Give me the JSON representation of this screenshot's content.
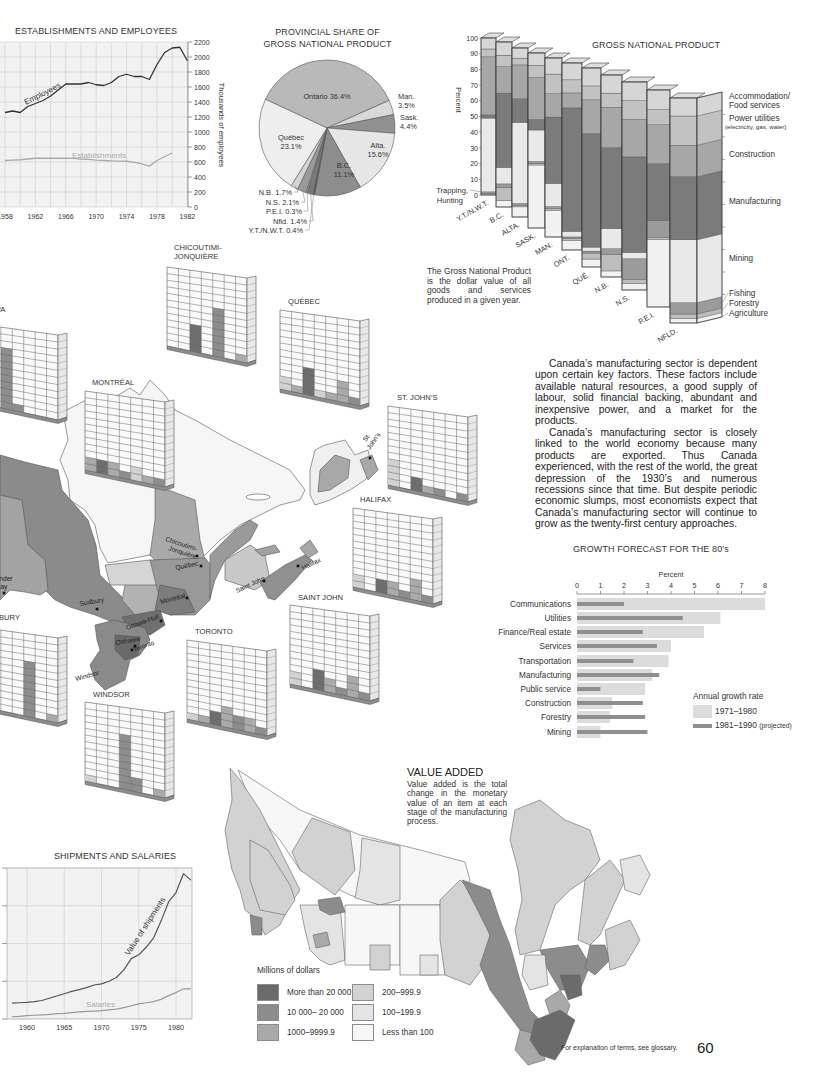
{
  "page": {
    "footnote": "For explanation of terms, see glossary.",
    "page_number": "60"
  },
  "establishments": {
    "title": "ESTABLISHMENTS AND EMPLOYEES",
    "y_axis_label": "Thousands of employees"
  },
  "pie": {
    "title_line1": "PROVINCIAL SHARE OF",
    "title_line2": "GROSS NATIONAL PRODUCT"
  },
  "gnp": {
    "title": "GROSS NATIONAL PRODUCT",
    "y_axis_label": "Percent",
    "trapping_label_line1": "Trapping,",
    "trapping_label_line2": "Hunting",
    "note": "The Gross National Product is the dollar value of all goods and services produced in a given year.",
    "sector_label_lines": [
      [
        "Agriculture"
      ],
      [
        "Forestry"
      ],
      [
        "Fishing"
      ],
      [
        "Mining"
      ],
      [
        "Manufacturing"
      ],
      [
        "Construction"
      ],
      [
        "Power utilities",
        "(electricity, gas, water)"
      ],
      [
        "Accommodation/",
        "Food services"
      ]
    ]
  },
  "body_text": {
    "p1": "Canada’s manufacturing sector is dependent upon certain key factors. These factors include available natural resources, a good supply of labour, solid financial backing, abundant and inexpensive power, and a market for the products.",
    "p2": "Canada’s manufacturing sector is closely linked to the world economy because many products are exported. Thus Canada experienced, with the rest of the world, the great depression of the 1930’s and numerous recessions since that time. But despite periodic economic slumps, most economists expect that Canada’s manufacturing sector will continue to grow as the twenty-first century approaches."
  },
  "growth": {
    "title": "GROWTH FORECAST FOR THE 80’s",
    "legend_title": "Annual growth rate",
    "legend_1": "1971–1980",
    "legend_2": "1981–1990",
    "legend_2_note": "(projected)"
  },
  "shipments": {
    "title": "SHIPMENTS AND SALARIES"
  },
  "value_added": {
    "title": "VALUE ADDED",
    "description": "Value added is the total change in the monetary value of an item at each stage of the manufacturing process.",
    "legend_title": "Millions of dollars",
    "legend": [
      {
        "label": "More than 20 000",
        "color": "#6b6b6b"
      },
      {
        "label": "10 000– 20 000",
        "color": "#8c8c8c"
      },
      {
        "label": "1000–9999.9",
        "color": "#a9a9a9"
      },
      {
        "label": "200–999.9",
        "color": "#d2d2d2"
      },
      {
        "label": "100–199.9",
        "color": "#e4e4e4"
      },
      {
        "label": "Less than 100",
        "color": "#f7f7f7"
      }
    ]
  },
  "map_labels": {
    "sudbury": "Sudbury",
    "chicoutimi_1": "Chicoutimi-",
    "chicoutimi_2": "Jonquière",
    "quebec": "Québec",
    "montreal": "Montréal",
    "ottawa_hull": "Ottawa-Hull",
    "oshawa": "Oshawa",
    "toronto": "Toronto",
    "windsor": "Windsor",
    "saint_john": "Saint John",
    "halifax": "Halifax",
    "st_johns_1": "St.",
    "st_johns_2": "John’s",
    "thunder_bay_1": "Thunder",
    "thunder_bay_2": "Bay"
  },
  "city_charts": [
    {
      "name": "OTTAWA",
      "columns": [
        [
          0,
          0
        ],
        [
          0,
          0
        ],
        [
          9,
          2
        ],
        [
          1,
          2
        ],
        [
          0,
          0
        ],
        [
          0,
          0
        ],
        [
          0,
          0
        ]
      ]
    },
    {
      "name": "CHICOUTIMI-",
      "name_line2": "JONQUIÈRE",
      "columns": [
        [
          0,
          0
        ],
        [
          0,
          0
        ],
        [
          4,
          1
        ],
        [
          0,
          0
        ],
        [
          7,
          2
        ],
        [
          0,
          0
        ],
        [
          1,
          3
        ]
      ]
    },
    {
      "name": "QUÉBEC",
      "columns": [
        [
          2,
          4
        ],
        [
          1,
          3
        ],
        [
          4,
          1
        ],
        [
          1,
          4
        ],
        [
          1,
          3
        ],
        [
          3,
          3
        ],
        [
          1,
          2
        ]
      ]
    },
    {
      "name": "MONTRÉAL",
      "columns": [
        [
          2,
          3
        ],
        [
          2,
          1
        ],
        [
          2,
          3
        ],
        [
          1,
          2
        ],
        [
          2,
          4
        ],
        [
          1,
          3
        ],
        [
          1,
          2
        ]
      ]
    },
    {
      "name": "ST. JOHN’S",
      "columns": [
        [
          4,
          4
        ],
        [
          0,
          0
        ],
        [
          2,
          1
        ],
        [
          1,
          3
        ],
        [
          1,
          2
        ],
        [
          0,
          0
        ],
        [
          1,
          2
        ]
      ]
    },
    {
      "name": "HALIFAX",
      "columns": [
        [
          2,
          4
        ],
        [
          0,
          0
        ],
        [
          2,
          1
        ],
        [
          2,
          3
        ],
        [
          1,
          2
        ],
        [
          3,
          3
        ],
        [
          1,
          2
        ]
      ]
    },
    {
      "name": "SAINT JOHN",
      "columns": [
        [
          2,
          4
        ],
        [
          0,
          0
        ],
        [
          3,
          1
        ],
        [
          2,
          3
        ],
        [
          1,
          2
        ],
        [
          3,
          3
        ],
        [
          1,
          2
        ]
      ]
    },
    {
      "name": "TORONTO",
      "columns": [
        [
          1,
          4
        ],
        [
          1,
          3
        ],
        [
          2,
          1
        ],
        [
          3,
          3
        ],
        [
          2,
          2
        ],
        [
          2,
          3
        ],
        [
          1,
          2
        ]
      ]
    },
    {
      "name": "WINDSOR",
      "columns": [
        [
          1,
          4
        ],
        [
          0,
          0
        ],
        [
          0,
          0
        ],
        [
          8,
          2
        ],
        [
          2,
          2
        ],
        [
          0,
          0
        ],
        [
          1,
          3
        ]
      ]
    },
    {
      "name": "SUDBURY",
      "columns": [
        [
          1,
          4
        ],
        [
          0,
          0
        ],
        [
          0,
          0
        ],
        [
          0,
          0
        ],
        [
          8,
          2
        ],
        [
          0,
          0
        ],
        [
          1,
          3
        ]
      ]
    }
  ],
  "shade_colors": {
    "1": "#6e6e6e",
    "2": "#8d8d8d",
    "3": "#aaaaaa",
    "4": "#d2d2d2"
  },
  "chart_data": [
    {
      "type": "line",
      "title": "ESTABLISHMENTS AND EMPLOYEES",
      "xlabel": "",
      "ylabel": "Thousands of employees",
      "x": [
        1958,
        1959,
        1960,
        1961,
        1962,
        1963,
        1964,
        1965,
        1966,
        1967,
        1968,
        1969,
        1970,
        1971,
        1972,
        1973,
        1974,
        1975,
        1976,
        1977,
        1978,
        1979,
        1980,
        1981,
        1982
      ],
      "xticks": [
        1958,
        1962,
        1966,
        1970,
        1974,
        1978,
        1982
      ],
      "yticks": [
        0,
        200,
        400,
        600,
        800,
        1000,
        1200,
        1400,
        1600,
        1800,
        2000,
        2200
      ],
      "ylim": [
        0,
        2200
      ],
      "grid": true,
      "series": [
        {
          "name": "Employees",
          "color": "#333333",
          "values": [
            1260,
            1280,
            1260,
            1340,
            1380,
            1420,
            1480,
            1560,
            1640,
            1640,
            1640,
            1660,
            1630,
            1620,
            1660,
            1740,
            1770,
            1740,
            1740,
            1700,
            1900,
            2060,
            2120,
            2130,
            1950
          ]
        },
        {
          "name": "Establishments",
          "color": "#aaaaaa",
          "values": [
            620,
            625,
            630,
            640,
            650,
            650,
            650,
            650,
            650,
            648,
            640,
            635,
            625,
            620,
            615,
            612,
            610,
            595,
            575,
            545,
            620,
            670,
            720,
            null,
            null
          ]
        }
      ]
    },
    {
      "type": "pie",
      "title": "PROVINCIAL SHARE OF GROSS NATIONAL PRODUCT",
      "start_angle_deg": 295,
      "slices": [
        {
          "label": "Ontario",
          "value": 36.4,
          "color": "#b9b9b9"
        },
        {
          "label": "Man.",
          "value": 3.5,
          "color": "#d9d9d9"
        },
        {
          "label": "Sask.",
          "value": 4.4,
          "color": "#909090"
        },
        {
          "label": "Alta.",
          "value": 15.6,
          "color": "#e6e6e6"
        },
        {
          "label": "B.C.",
          "value": 11.1,
          "color": "#8d8d8d"
        },
        {
          "label": "Y.T./N.W.T.",
          "value": 0.4,
          "color": "#555555"
        },
        {
          "label": "Nfld.",
          "value": 1.4,
          "color": "#7a7a7a"
        },
        {
          "label": "P.E.I.",
          "value": 0.3,
          "color": "#c8c8c8"
        },
        {
          "label": "N.S.",
          "value": 2.1,
          "color": "#9a9a9a"
        },
        {
          "label": "N.B.",
          "value": 1.7,
          "color": "#d4d4d4"
        },
        {
          "label": "Québec",
          "value": 23.1,
          "color": "#eeeeee"
        }
      ]
    },
    {
      "type": "bar",
      "stacked": true,
      "title": "GROSS NATIONAL PRODUCT",
      "xlabel": "",
      "ylabel": "Percent",
      "ylim": [
        0,
        100
      ],
      "yticks": [
        0,
        10,
        20,
        30,
        40,
        50,
        60,
        70,
        80,
        90,
        100
      ],
      "categories": [
        "Y.T./N.W.T.",
        "B.C.",
        "ALTA.",
        "SASK.",
        "MAN.",
        "ONT.",
        "QUÉ.",
        "N.B.",
        "N.S.",
        "P.E.I.",
        "NFLD."
      ],
      "annotations": [
        "Trapping, Hunting"
      ],
      "series": [
        {
          "name": "Agriculture",
          "color": "#f1f1f1",
          "values": [
            0,
            4,
            6,
            36,
            15,
            5,
            4,
            3,
            3,
            31,
            2
          ]
        },
        {
          "name": "Forestry",
          "color": "#bdbdbd",
          "values": [
            1,
            8,
            1,
            1,
            1,
            1,
            3,
            8,
            2,
            1,
            2
          ]
        },
        {
          "name": "Fishing",
          "color": "#9b9b9b",
          "values": [
            1,
            2,
            1,
            1,
            1,
            1,
            1,
            3,
            10,
            8,
            5
          ]
        },
        {
          "name": "Mining",
          "color": "#e9e9e9",
          "values": [
            47,
            10,
            48,
            18,
            13,
            3,
            2,
            10,
            3,
            0,
            28
          ]
        },
        {
          "name": "Manufacturing",
          "color": "#7b7b7b",
          "values": [
            2,
            45,
            14,
            6,
            37,
            66,
            57,
            40,
            46,
            26,
            28
          ]
        },
        {
          "name": "Construction",
          "color": "#a7a7a7",
          "values": [
            37,
            16,
            20,
            24,
            13,
            8,
            17,
            20,
            18,
            18,
            14
          ]
        },
        {
          "name": "Power utilities (electricity, gas, water)",
          "color": "#c2c2c2",
          "values": [
            5,
            7,
            4,
            7,
            11,
            7,
            7,
            7,
            9,
            7,
            13
          ]
        },
        {
          "name": "Accommodation/Food services",
          "color": "#d6d6d6",
          "values": [
            7,
            8,
            6,
            7,
            9,
            9,
            9,
            9,
            9,
            9,
            8
          ]
        }
      ]
    },
    {
      "type": "bar",
      "orientation": "horizontal",
      "title": "GROWTH FORECAST FOR THE 80’s",
      "xlabel": "Percent",
      "ylabel": "",
      "xlim": [
        0,
        8
      ],
      "xticks": [
        0,
        1,
        2,
        3,
        4,
        5,
        6,
        7,
        8
      ],
      "legend_title": "Annual growth rate",
      "legend_position": "lower right",
      "categories": [
        "Communications",
        "Utilities",
        "Finance/Real estate",
        "Services",
        "Transportation",
        "Manufacturing",
        "Public service",
        "Construction",
        "Forestry",
        "Mining"
      ],
      "series": [
        {
          "name": "1971–1980",
          "color": "#dcdcdc",
          "values": [
            8.0,
            6.1,
            5.4,
            4.0,
            3.9,
            3.2,
            2.9,
            1.5,
            1.4,
            1.0
          ]
        },
        {
          "name": "1981–1990 (projected)",
          "color": "#8f8f8f",
          "values": [
            2.0,
            4.5,
            2.8,
            3.4,
            2.4,
            3.5,
            1.0,
            2.8,
            2.9,
            3.0
          ]
        }
      ]
    },
    {
      "type": "line",
      "title": "SHIPMENTS AND SALARIES",
      "xlabel": "",
      "ylabel": "",
      "x": [
        1958,
        1959,
        1960,
        1961,
        1962,
        1963,
        1964,
        1965,
        1966,
        1967,
        1968,
        1969,
        1970,
        1971,
        1972,
        1973,
        1974,
        1975,
        1976,
        1977,
        1978,
        1979,
        1980,
        1981,
        1982
      ],
      "xticks": [
        1960,
        1965,
        1970,
        1975,
        1980
      ],
      "ylim": [
        0,
        4
      ],
      "grid": true,
      "series": [
        {
          "name": "Value of shipments",
          "color": "#555555",
          "values": [
            0.42,
            0.43,
            0.44,
            0.46,
            0.49,
            0.55,
            0.61,
            0.67,
            0.73,
            0.78,
            0.83,
            0.9,
            0.93,
            1.0,
            1.1,
            1.3,
            1.6,
            1.7,
            1.9,
            2.15,
            2.6,
            3.1,
            3.35,
            3.85,
            3.68
          ]
        },
        {
          "name": "Salaries",
          "color": "#999999",
          "values": [
            0.06,
            0.07,
            0.09,
            0.1,
            0.11,
            0.12,
            0.14,
            0.15,
            0.17,
            0.19,
            0.2,
            0.21,
            0.22,
            0.24,
            0.26,
            0.3,
            0.35,
            0.4,
            0.43,
            0.46,
            0.52,
            0.62,
            0.7,
            0.8,
            0.8
          ]
        }
      ]
    }
  ]
}
